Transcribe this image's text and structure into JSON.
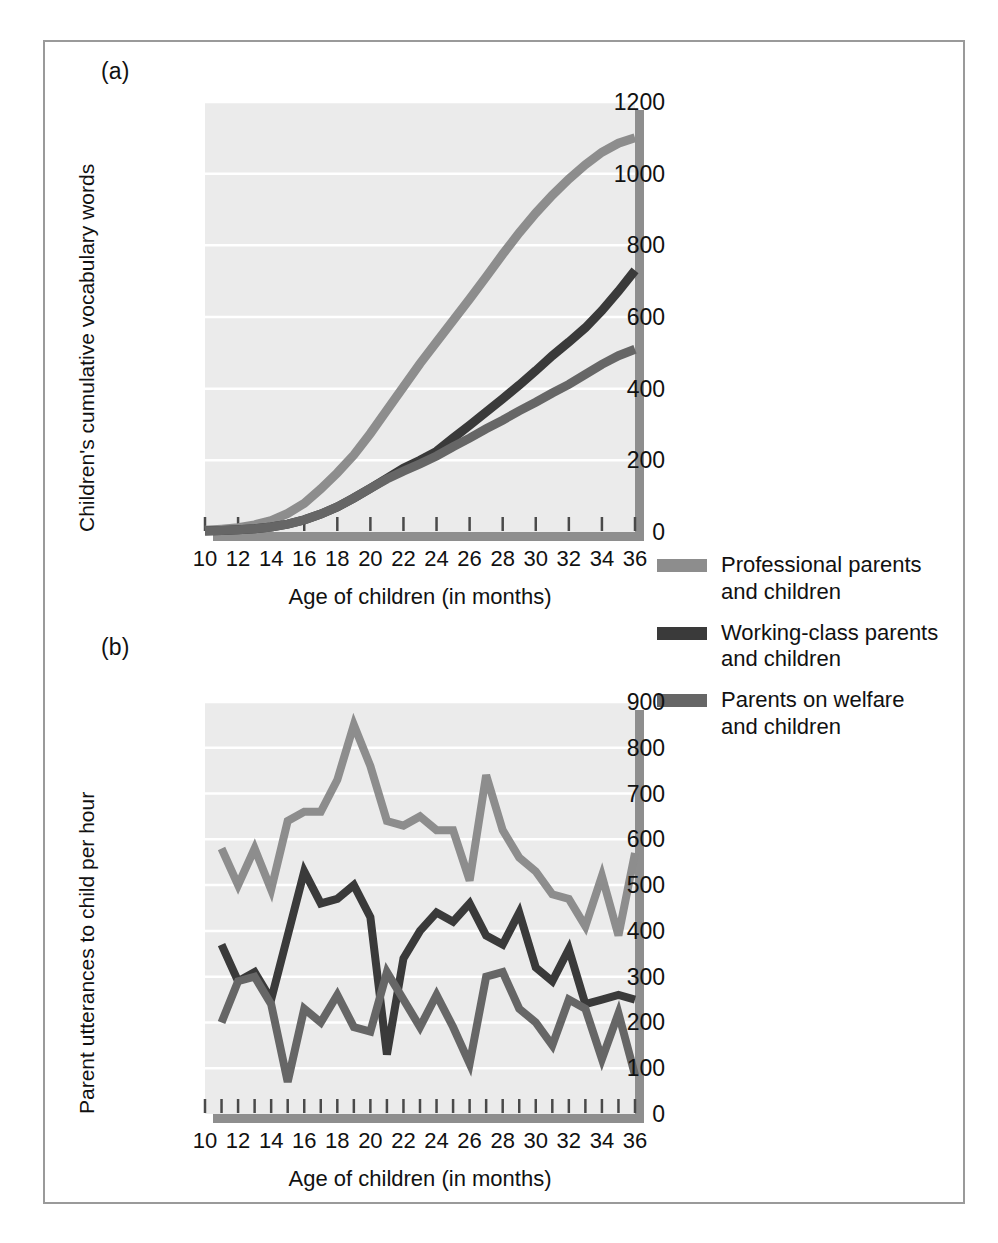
{
  "figure": {
    "panel_a_tag": "(a)",
    "panel_b_tag": "(b)"
  },
  "colors": {
    "professional": "#8d8d8d",
    "working_class": "#3a3a3a",
    "welfare": "#666666",
    "plot_background": "#ebebeb",
    "gridline": "#ffffff",
    "axis_shadow": "#8e8e8e",
    "frame": "#9a9a9a"
  },
  "legend": {
    "items": [
      {
        "label": "Professional parents\nand children",
        "color_key": "professional",
        "swatch": "#8d8d8d"
      },
      {
        "label": "Working-class parents\nand children",
        "color_key": "working_class",
        "swatch": "#3a3a3a"
      },
      {
        "label": "Parents on welfare\nand children",
        "color_key": "welfare",
        "swatch": "#666666"
      }
    ]
  },
  "chart_data": [
    {
      "id": "panel-a",
      "type": "line",
      "title": "",
      "panel": "(a)",
      "xlabel": "Age of children (in months)",
      "ylabel": "Children's cumulative vocabulary words",
      "xlim": [
        10,
        36
      ],
      "ylim": [
        0,
        1200
      ],
      "yticks": [
        0,
        200,
        400,
        600,
        800,
        1000,
        1200
      ],
      "ytick_labels": [
        "0",
        "200",
        "400",
        "600",
        "800",
        "1000",
        "1200"
      ],
      "xticks": [
        10,
        12,
        14,
        16,
        18,
        20,
        22,
        24,
        26,
        28,
        30,
        32,
        34,
        36
      ],
      "xtick_labels": [
        "10",
        "12",
        "14",
        "16",
        "18",
        "20",
        "22",
        "24",
        "26",
        "28",
        "30",
        "32",
        "34",
        "36"
      ],
      "grid": true,
      "legend_position": "right",
      "x": [
        10,
        11,
        12,
        13,
        14,
        15,
        16,
        17,
        18,
        19,
        20,
        21,
        22,
        23,
        24,
        25,
        26,
        27,
        28,
        29,
        30,
        31,
        32,
        33,
        34,
        35,
        36
      ],
      "series": [
        {
          "name": "Professional parents and children",
          "color": "#8d8d8d",
          "values": [
            5,
            8,
            12,
            20,
            32,
            52,
            80,
            120,
            165,
            215,
            275,
            340,
            405,
            470,
            530,
            590,
            650,
            712,
            775,
            835,
            890,
            940,
            985,
            1025,
            1060,
            1085,
            1100
          ]
        },
        {
          "name": "Working-class parents and children",
          "color": "#3a3a3a",
          "values": [
            3,
            4,
            6,
            9,
            14,
            22,
            34,
            50,
            70,
            95,
            122,
            150,
            178,
            200,
            225,
            262,
            298,
            335,
            372,
            410,
            450,
            492,
            530,
            570,
            618,
            672,
            730
          ]
        },
        {
          "name": "Parents on welfare and children",
          "color": "#666666",
          "values": [
            3,
            4,
            6,
            9,
            14,
            22,
            34,
            50,
            70,
            95,
            122,
            148,
            170,
            190,
            212,
            238,
            262,
            288,
            312,
            338,
            362,
            388,
            412,
            440,
            468,
            492,
            510
          ]
        }
      ]
    },
    {
      "id": "panel-b",
      "type": "line",
      "title": "",
      "panel": "(b)",
      "xlabel": "Age of children (in months)",
      "ylabel": "Parent utterances to child per hour",
      "xlim": [
        10,
        36
      ],
      "ylim": [
        0,
        900
      ],
      "yticks": [
        0,
        100,
        200,
        300,
        400,
        500,
        600,
        700,
        800,
        900
      ],
      "ytick_labels": [
        "0",
        "100",
        "200",
        "300",
        "400",
        "500",
        "600",
        "700",
        "800",
        "900"
      ],
      "xticks": [
        10,
        12,
        14,
        16,
        18,
        20,
        22,
        24,
        26,
        28,
        30,
        32,
        34,
        36
      ],
      "xtick_labels": [
        "10",
        "12",
        "14",
        "16",
        "18",
        "20",
        "22",
        "24",
        "26",
        "28",
        "30",
        "32",
        "34",
        "36"
      ],
      "grid": true,
      "legend_position": "right",
      "x": [
        11,
        12,
        13,
        14,
        15,
        16,
        17,
        18,
        19,
        20,
        21,
        22,
        23,
        24,
        25,
        26,
        27,
        28,
        29,
        30,
        31,
        32,
        33,
        34,
        35,
        36
      ],
      "series": [
        {
          "name": "Professional parents and children",
          "color": "#8d8d8d",
          "values": [
            580,
            500,
            580,
            490,
            640,
            660,
            660,
            730,
            850,
            760,
            640,
            630,
            650,
            620,
            620,
            510,
            740,
            620,
            560,
            530,
            480,
            470,
            410,
            520,
            390,
            570
          ]
        },
        {
          "name": "Working-class parents and children",
          "color": "#3a3a3a",
          "values": [
            370,
            290,
            310,
            250,
            390,
            530,
            460,
            470,
            500,
            430,
            130,
            340,
            400,
            440,
            420,
            460,
            390,
            370,
            440,
            320,
            290,
            360,
            240,
            250,
            260,
            250
          ]
        },
        {
          "name": "Parents on welfare and children",
          "color": "#666666",
          "values": [
            200,
            290,
            300,
            240,
            70,
            230,
            200,
            260,
            190,
            180,
            310,
            250,
            190,
            260,
            190,
            110,
            300,
            310,
            230,
            200,
            150,
            250,
            230,
            120,
            220,
            85
          ]
        }
      ]
    }
  ]
}
